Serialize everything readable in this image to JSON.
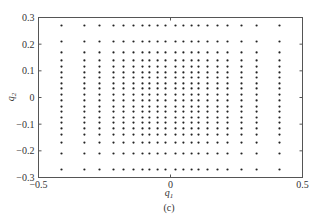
{
  "chart_data": {
    "type": "scatter",
    "title": "",
    "caption": "(c)",
    "xlabel": "q",
    "xlabel_sub": "1",
    "ylabel": "q",
    "ylabel_sub": "2",
    "xlim": [
      -0.5,
      0.5
    ],
    "ylim": [
      -0.3,
      0.3
    ],
    "xticks": [
      -0.5,
      0,
      0.5
    ],
    "xtick_labels": [
      "−0.5",
      "0",
      "0.5"
    ],
    "yticks": [
      -0.3,
      -0.2,
      -0.1,
      0,
      0.1,
      0.2,
      0.3
    ],
    "ytick_labels": [
      "−0.3",
      "−0.2",
      "−0.1",
      "0",
      "0.1",
      "0.2",
      "0.3"
    ],
    "grid": false,
    "legend": null,
    "marker": "dot",
    "marker_color": "#222222",
    "x_levels": [
      -0.413,
      -0.326,
      -0.269,
      -0.216,
      -0.178,
      -0.14,
      -0.106,
      -0.08,
      -0.049,
      -0.019,
      0.019,
      0.049,
      0.08,
      0.106,
      0.14,
      0.178,
      0.216,
      0.269,
      0.326,
      0.413
    ],
    "y_levels": [
      0.27,
      0.21,
      0.169,
      0.139,
      0.116,
      0.094,
      0.075,
      0.053,
      0.034,
      0.011,
      -0.011,
      -0.034,
      -0.053,
      -0.075,
      -0.094,
      -0.116,
      -0.139,
      -0.169,
      -0.21,
      -0.27
    ]
  }
}
